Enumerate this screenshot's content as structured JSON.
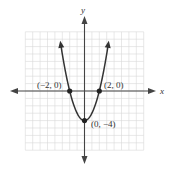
{
  "chart_data": {
    "type": "line",
    "title": "",
    "function": "y = x^2 - 4",
    "xlabel": "x",
    "ylabel": "y",
    "xlim": [
      -8,
      8
    ],
    "ylim": [
      -8,
      8
    ],
    "grid": true,
    "legend": null,
    "series": [
      {
        "name": "parabola",
        "x": [
          -3.4,
          -3,
          -2,
          -1,
          0,
          1,
          2,
          3,
          3.4
        ],
        "y": [
          7.56,
          5,
          0,
          -3,
          -4,
          -3,
          0,
          5,
          7.56
        ]
      }
    ],
    "points": [
      {
        "x": -2,
        "y": 0,
        "label": "(−2, 0)"
      },
      {
        "x": 2,
        "y": 0,
        "label": "(2, 0)"
      },
      {
        "x": 0,
        "y": -4,
        "label": "(0, −4)"
      }
    ]
  },
  "labels": {
    "x_axis": "x",
    "y_axis": "y",
    "p_left": "(−2, 0)",
    "p_right": "(2, 0)",
    "p_vertex": "(0, −4)"
  },
  "colors": {
    "grid": "#d9d9d9",
    "curve": "#333333",
    "axis": "#444444"
  }
}
